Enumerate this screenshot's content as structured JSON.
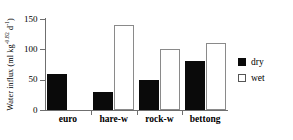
{
  "chart_data": {
    "type": "bar",
    "title": "",
    "xlabel": "",
    "ylabel": "Water influx (ml kg⁻⁰⋅⁸² d⁻¹)",
    "ylabel_parts": {
      "prefix": "Water influx (ml kg",
      "sup1": "-0.82",
      "mid": " d",
      "sup2": "-1",
      "suffix": ")"
    },
    "categories": [
      "euro",
      "hare-w",
      "rock-w",
      "bettong"
    ],
    "series": [
      {
        "name": "dry",
        "color": "#0a0a0a",
        "fill": "solid",
        "values": [
          60,
          30,
          50,
          80
        ]
      },
      {
        "name": "wet",
        "color": "#ffffff",
        "fill": "open",
        "values": [
          null,
          140,
          100,
          110
        ]
      }
    ],
    "ylim": [
      0,
      150
    ],
    "yticks": [
      0,
      50,
      100,
      150
    ],
    "ytick_labels": [
      "0",
      "50",
      "100",
      "150"
    ],
    "grid": false,
    "legend_position": "right"
  },
  "legend": {
    "entries": [
      {
        "label": "dry",
        "swatch": "filled-square-icon"
      },
      {
        "label": "wet",
        "swatch": "open-square-icon"
      }
    ]
  }
}
